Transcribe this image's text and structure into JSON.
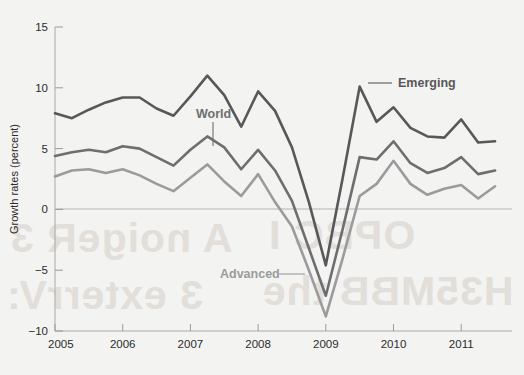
{
  "chart_data": {
    "type": "line",
    "title": "",
    "subtitle": "",
    "xlabel": "",
    "ylabel": "Growth rates (percent)",
    "xlim": [
      2005.0,
      2011.75
    ],
    "ylim": [
      -10,
      15
    ],
    "yticks": [
      15,
      10,
      5,
      0,
      -5,
      -10
    ],
    "ytick_labels": [
      "15",
      "10",
      "5",
      "0",
      "−5",
      "−10"
    ],
    "xticks": [
      2005,
      2006,
      2007,
      2008,
      2009,
      2010,
      2011
    ],
    "xtick_labels": [
      "2005",
      "2006",
      "2007",
      "2008",
      "2009",
      "2010",
      "2011"
    ],
    "grid": false,
    "zero_line": true,
    "legend_position": "inline-annotations",
    "x": [
      2005.0,
      2005.25,
      2005.5,
      2005.75,
      2006.0,
      2006.25,
      2006.5,
      2006.75,
      2007.0,
      2007.25,
      2007.5,
      2007.75,
      2008.0,
      2008.25,
      2008.5,
      2008.75,
      2009.0,
      2009.25,
      2009.5,
      2009.75,
      2010.0,
      2010.25,
      2010.5,
      2010.75,
      2011.0,
      2011.25,
      2011.5
    ],
    "series": [
      {
        "name": "Emerging",
        "color": "#58585a",
        "values": [
          7.9,
          7.5,
          8.2,
          8.8,
          9.2,
          9.2,
          8.3,
          7.7,
          9.3,
          11.0,
          9.4,
          6.8,
          9.7,
          8.1,
          5.1,
          0.6,
          -4.6,
          2.6,
          10.1,
          7.2,
          8.4,
          6.7,
          6.0,
          5.9,
          7.4,
          5.5,
          5.6
        ]
      },
      {
        "name": "World",
        "color": "#6e6e70",
        "values": [
          4.4,
          4.7,
          4.9,
          4.7,
          5.2,
          5.0,
          4.3,
          3.6,
          4.9,
          6.0,
          5.1,
          3.3,
          4.9,
          3.2,
          0.7,
          -3.2,
          -7.1,
          -1.6,
          4.3,
          4.1,
          5.6,
          3.8,
          3.0,
          3.4,
          4.3,
          2.9,
          3.2
        ]
      },
      {
        "name": "Advanced",
        "color": "#9b9b9d",
        "values": [
          2.7,
          3.2,
          3.3,
          3.0,
          3.3,
          2.8,
          2.1,
          1.5,
          2.6,
          3.7,
          2.3,
          1.1,
          2.9,
          0.6,
          -1.4,
          -5.0,
          -8.8,
          -4.0,
          1.1,
          2.1,
          4.0,
          2.1,
          1.2,
          1.7,
          2.0,
          0.9,
          1.9
        ]
      }
    ],
    "annotations": [
      {
        "label": "World",
        "color": "#6e6e70",
        "text_x": 196,
        "text_y": 118,
        "leader_from_x": 213,
        "leader_from_y": 122,
        "leader_to_x": 213,
        "leader_to_y": 146
      },
      {
        "label": "Emerging",
        "color": "#58585a",
        "text_x": 398,
        "text_y": 87,
        "leader_from_x": 392,
        "leader_from_y": 83,
        "leader_to_x": 368,
        "leader_to_y": 83
      },
      {
        "label": "Advanced",
        "color": "#9b9b9d",
        "text_x": 220,
        "text_y": 278,
        "leader_from_x": 279,
        "leader_from_y": 274,
        "leader_to_x": 305,
        "leader_to_y": 274
      }
    ]
  },
  "page_bleed_through": {
    "line_1": "A noigeR 3",
    "line_2": "3 exterrV:",
    "line_3": "OPBC  I",
    "line_4": "H35MBB  the"
  }
}
